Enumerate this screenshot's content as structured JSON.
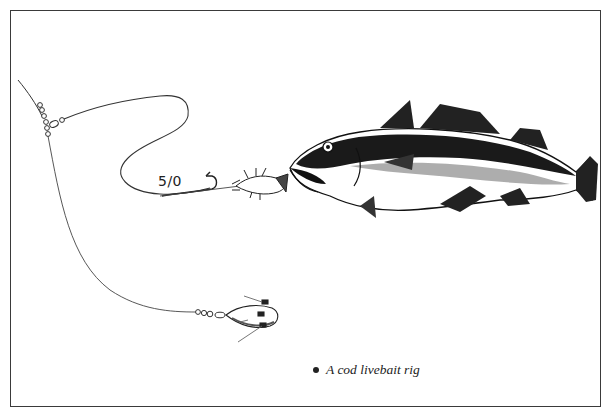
{
  "figure": {
    "title": "A cod livebait rig",
    "caption": "A cod livebait rig",
    "labels": {
      "hook_size": "5/0"
    },
    "components": [
      {
        "name": "main-line",
        "description": "Main line with swivel beads"
      },
      {
        "name": "hook-trace",
        "description": "Long flowing hook trace"
      },
      {
        "name": "hook",
        "description": "5/0 hook"
      },
      {
        "name": "livebait",
        "description": "Small livebait fish on hook"
      },
      {
        "name": "cod",
        "description": "Cod taking the livebait"
      },
      {
        "name": "weight-trace",
        "description": "Lead weight trace with swivels"
      },
      {
        "name": "lead-weight",
        "description": "Grip lead weight with wires"
      }
    ],
    "colors": {
      "ink": "#222222",
      "background": "#ffffff",
      "border": "#3a3a3a"
    }
  }
}
